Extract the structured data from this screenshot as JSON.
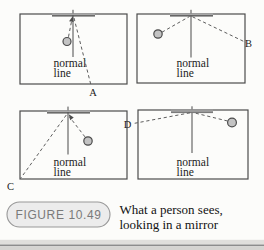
{
  "figure": {
    "label": "FIGURE 10.49",
    "caption_line1": "What a person sees,",
    "caption_line2": "looking in a mirror"
  },
  "panels": [
    {
      "name": "top-left",
      "normal_word1": "normal",
      "normal_word2": "line",
      "ray_label": "A"
    },
    {
      "name": "top-right",
      "normal_word1": "normal",
      "normal_word2": "line",
      "ray_label": "B"
    },
    {
      "name": "bottom-left",
      "normal_word1": "normal",
      "normal_word2": "line",
      "ray_label": "C"
    },
    {
      "name": "bottom-right",
      "normal_word1": "normal",
      "normal_word2": "line",
      "ray_label": "D"
    }
  ],
  "colors": {
    "box_stroke": "#4b4b4b",
    "ray_dash": "#5d5d5d",
    "mirror_gray": "#a8a8a8",
    "eye_fill": "#c3c3c3",
    "pill_fill": "#ececec",
    "pill_stroke": "#989898",
    "pill_text": "#7a7a7a",
    "caption_text": "#121212",
    "page_edge_band": "#e0dfdc",
    "page_edge_line": "#8d8d8d"
  }
}
